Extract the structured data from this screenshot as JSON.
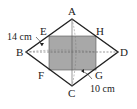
{
  "diagram": {
    "type": "geometry",
    "shape": "rhombus",
    "vertices": {
      "A": {
        "label": "A",
        "x": 72,
        "y": 19
      },
      "B": {
        "label": "B",
        "x": 26,
        "y": 52
      },
      "C": {
        "label": "C",
        "x": 72,
        "y": 86
      },
      "D": {
        "label": "D",
        "x": 118,
        "y": 52
      }
    },
    "points": {
      "E": {
        "label": "E"
      },
      "F": {
        "label": "F"
      },
      "G": {
        "label": "G"
      },
      "H": {
        "label": "H"
      }
    },
    "inner_rectangle": {
      "label": "EFGH",
      "fill": "#a9a9a9"
    },
    "dimensions": {
      "left": "14 cm",
      "bottom_right": "10 cm"
    },
    "colors": {
      "stroke": "#222222",
      "shade": "#a8a8a8",
      "dash": "#555555"
    }
  }
}
